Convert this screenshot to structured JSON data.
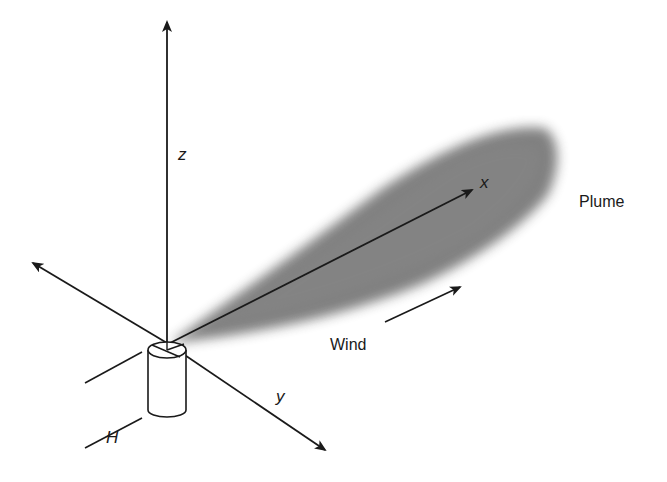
{
  "diagram": {
    "labels": {
      "z_axis": "z",
      "x_axis": "x",
      "y_axis": "y",
      "stack_height": "H",
      "plume": "Plume",
      "wind": "Wind"
    },
    "colors": {
      "line": "#1a1a1a",
      "plume": "#6e6e6e",
      "background": "#ffffff"
    }
  }
}
